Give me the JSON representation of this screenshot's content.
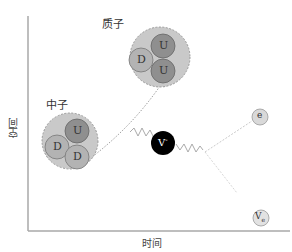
{
  "axes": {
    "x_label": "时间",
    "y_label": "空间",
    "color": "#9a9a9a"
  },
  "proton": {
    "label": "质子",
    "quarks": [
      "D",
      "U",
      "U"
    ]
  },
  "neutron": {
    "label": "中子",
    "quarks": [
      "D",
      "U",
      "D"
    ]
  },
  "boson": {
    "label": "V",
    "sup": "-"
  },
  "electron": {
    "label": "e"
  },
  "neutrino": {
    "label": "V",
    "sub": "e"
  },
  "colors": {
    "hadron_fill": "#c9c9c9",
    "quark_d": "#b3b3b3",
    "quark_u": "#8f8f8f",
    "boson_fill": "#000000",
    "lepton_fill": "#d9d9d9",
    "line": "#999999"
  }
}
